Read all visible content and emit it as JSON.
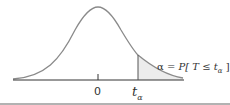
{
  "diagram": {
    "labels": {
      "zero": "0",
      "t": "t",
      "t_subscript": "α",
      "equation_alpha": "α",
      "equation_eq": " = ",
      "equation_P": "P",
      "equation_body": "[ T ≤ t",
      "equation_sub": "α",
      "equation_close": " ]"
    },
    "colors": {
      "curve": "#8a8a8a",
      "axis": "#333333",
      "shade": "#ececec",
      "rule": "#999999"
    }
  }
}
